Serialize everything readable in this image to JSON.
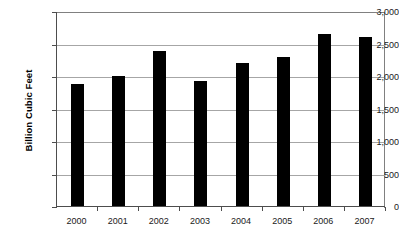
{
  "chart_data": {
    "type": "bar",
    "title": "",
    "xlabel": "",
    "ylabel": "Billion Cubic Feet",
    "categories": [
      "2000",
      "2001",
      "2002",
      "2003",
      "2004",
      "2005",
      "2006",
      "2007"
    ],
    "values": [
      1880,
      2000,
      2390,
      1920,
      2200,
      2290,
      2650,
      2600
    ],
    "ylim": [
      0,
      3000
    ],
    "ytick_values": [
      0,
      500,
      1000,
      1500,
      2000,
      2500,
      3000
    ],
    "ytick_labels": [
      "0",
      "500",
      "1,000",
      "1,500",
      "2,000",
      "2,500",
      "3,000"
    ],
    "grid": true,
    "legend": false,
    "bar_color": "#000000",
    "grid_color": "#a6a6a6",
    "axis_color": "#4d4d4d",
    "background_color": "#ffffff"
  }
}
